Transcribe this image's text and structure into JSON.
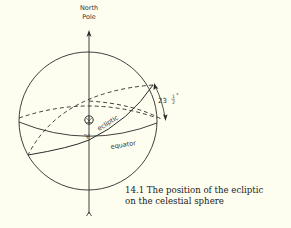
{
  "figure": {
    "pole_label_line1": "North",
    "pole_label_line2": "Pole",
    "ecliptic_label": "ecliptic",
    "equator_label": "equator",
    "angle_label_whole": "23",
    "angle_label_num": "1",
    "angle_label_den": "2",
    "angle_label_unit": "°",
    "angle_value": "23½°",
    "aries_symbol": "♈",
    "sun_symbol": "sun-symbol",
    "caption_line1": "14.1  The position of the ecliptic",
    "caption_line2": "on the celestial sphere"
  },
  "colors": {
    "background": "#fefef0",
    "ink": "#2a2a2a"
  }
}
